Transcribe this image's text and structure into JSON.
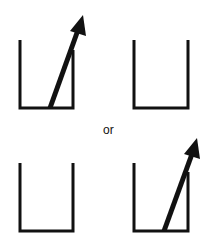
{
  "diagram": {
    "separator_text": "or",
    "stroke_color": "#111111",
    "background": "#ffffff",
    "panels": [
      {
        "id": "top-left",
        "has_arrow": true
      },
      {
        "id": "top-right",
        "has_arrow": false
      },
      {
        "id": "bottom-left",
        "has_arrow": false
      },
      {
        "id": "bottom-right",
        "has_arrow": true
      }
    ]
  }
}
